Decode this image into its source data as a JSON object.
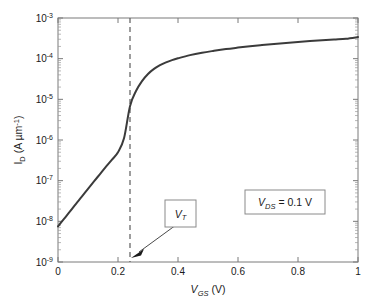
{
  "chart_data": {
    "type": "line",
    "title": "",
    "xlabel": "V_GS (V)",
    "xlabel_parts": {
      "main": "V",
      "sub": "GS",
      "unit": " (V)"
    },
    "ylabel": "I_D (A um^-1)",
    "ylabel_parts": {
      "main": "I",
      "sub": "D",
      "unit": " (A µm",
      "unit_sup": "-1",
      "unit_close": ")"
    },
    "xlim": [
      0,
      1
    ],
    "ylim": [
      1e-09,
      0.001
    ],
    "yscale": "log",
    "xscale": "linear",
    "grid": false,
    "legend": "none",
    "x_ticks": [
      "0",
      "0.2",
      "0.4",
      "0.6",
      "0.8",
      "1"
    ],
    "x_tick_values": [
      0,
      0.2,
      0.4,
      0.6,
      0.8,
      1
    ],
    "y_ticks": [
      "10−3",
      "10−4",
      "10−5",
      "10−6",
      "10−7",
      "10−8",
      "10−9"
    ],
    "y_tick_exponents": [
      "-3",
      "-4",
      "-5",
      "-6",
      "-7",
      "-8",
      "-9"
    ],
    "y_tick_values": [
      0.001,
      0.0001,
      1e-05,
      1e-06,
      1e-07,
      1e-08,
      1e-09
    ],
    "series": [
      {
        "name": "I_D transfer characteristic",
        "color": "#3b3b3b",
        "x": [
          0.0,
          0.02,
          0.04,
          0.06,
          0.08,
          0.1,
          0.12,
          0.14,
          0.16,
          0.18,
          0.2,
          0.22,
          0.24,
          0.26,
          0.28,
          0.3,
          0.32,
          0.34,
          0.36,
          0.38,
          0.4,
          0.44,
          0.48,
          0.52,
          0.56,
          0.6,
          0.64,
          0.68,
          0.72,
          0.76,
          0.8,
          0.84,
          0.88,
          0.92,
          0.96,
          1.0
        ],
        "y": [
          7.5e-09,
          1.15e-08,
          1.75e-08,
          2.7e-08,
          4.1e-08,
          6.3e-08,
          9.6e-08,
          1.45e-07,
          2.2e-07,
          3.3e-07,
          5e-07,
          1.1e-06,
          6.8e-06,
          1.6e-05,
          2.8e-05,
          4.2e-05,
          5.6e-05,
          6.9e-05,
          8.1e-05,
          9.2e-05,
          0.000102,
          0.000122,
          0.00014,
          0.000156,
          0.000172,
          0.000187,
          0.000202,
          0.000216,
          0.00023,
          0.000244,
          0.000257,
          0.00027,
          0.000283,
          0.000296,
          0.000309,
          0.00034
        ]
      }
    ],
    "annotations": [
      {
        "id": "vt-marker",
        "type": "vertical-dashed-line",
        "x": 0.24,
        "label": "V_T",
        "label_parts": {
          "main": "V",
          "sub": "T"
        },
        "boxed": true
      },
      {
        "id": "vds-label",
        "type": "text-box",
        "label": "V_DS = 0.1 V",
        "label_parts": {
          "main": "V",
          "sub": "DS",
          "rest": " = 0.1 V"
        },
        "boxed": true
      }
    ]
  },
  "figure": {
    "background_color": "#ffffff",
    "axis_color": "#7a7a7a",
    "curve_color": "#3b3b3b",
    "dashed_color": "#5c5c5c"
  }
}
